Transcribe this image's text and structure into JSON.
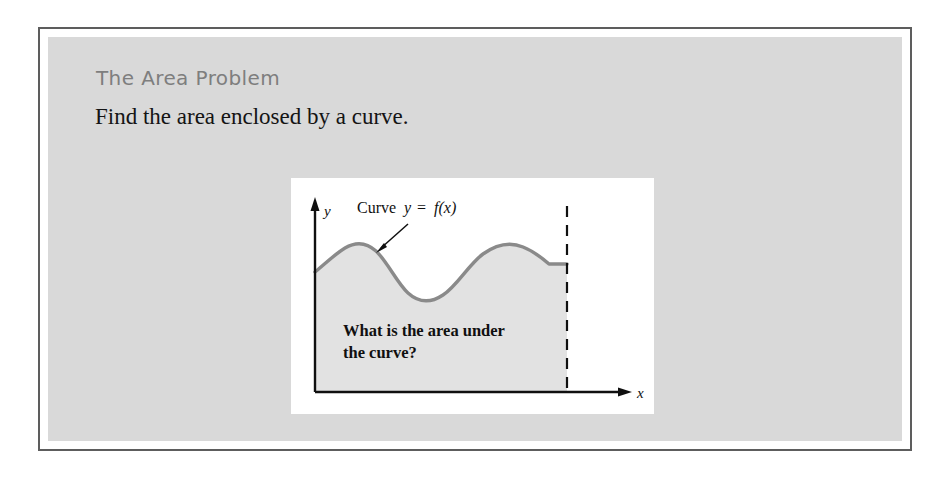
{
  "slide": {
    "title": "The Area Problem",
    "subtitle": "Find the area enclosed by a curve."
  },
  "figure": {
    "y_axis_label": "y",
    "x_axis_label": "x",
    "curve_label": {
      "prefix": "Curve",
      "variable": "y",
      "equals": "=",
      "function": "f(x)"
    },
    "question_line1": "What is the area under",
    "question_line2": "the curve?"
  },
  "colors": {
    "frame_border": "#5d5d5d",
    "panel_background": "#d9d9d9",
    "figure_background": "#ffffff",
    "title_text": "#7e7e7e",
    "body_text": "#141414",
    "curve_stroke": "#8a8a8a",
    "area_fill": "#e2e2e2",
    "axis_stroke": "#101010"
  }
}
